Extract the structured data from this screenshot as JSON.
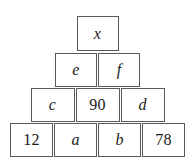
{
  "diagram": {
    "kind": "number-pyramid",
    "border_color": "#5a5a5a",
    "text_color": "#1a1a1a",
    "background_color": "#ffffff",
    "rows": [
      {
        "index": 1,
        "cells": [
          {
            "label": "x",
            "kind": "variable"
          }
        ]
      },
      {
        "index": 2,
        "cells": [
          {
            "label": "e",
            "kind": "variable"
          },
          {
            "label": "f",
            "kind": "variable"
          }
        ]
      },
      {
        "index": 3,
        "cells": [
          {
            "label": "c",
            "kind": "variable"
          },
          {
            "label": "90",
            "kind": "number"
          },
          {
            "label": "d",
            "kind": "variable"
          }
        ]
      },
      {
        "index": 4,
        "cells": [
          {
            "label": "12",
            "kind": "number"
          },
          {
            "label": "a",
            "kind": "variable"
          },
          {
            "label": "b",
            "kind": "variable"
          },
          {
            "label": "78",
            "kind": "number"
          }
        ]
      }
    ]
  }
}
